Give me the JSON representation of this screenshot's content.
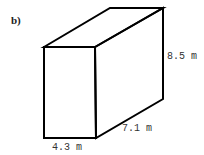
{
  "figure": {
    "part_label": "b)",
    "shape": "rectangular prism",
    "dimensions": {
      "height": "8.5 m",
      "depth": "7.1 m",
      "width": "4.3 m"
    },
    "colors": {
      "stroke": "#000000",
      "text": "#333333",
      "background": "#ffffff"
    }
  }
}
